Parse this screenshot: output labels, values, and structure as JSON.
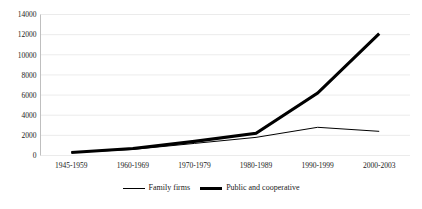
{
  "chart_data": {
    "type": "line",
    "title": "",
    "subtitle": "",
    "xlabel": "",
    "ylabel": "",
    "categories": [
      "1945-1959",
      "1960-1969",
      "1970-1979",
      "1980-1989",
      "1990-1999",
      "2000-2003"
    ],
    "series": [
      {
        "name": "Family firms",
        "values": [
          300,
          600,
          1200,
          1800,
          2800,
          2400
        ],
        "line_style": "thin",
        "color": "#000000"
      },
      {
        "name": "Public and cooperative",
        "values": [
          300,
          700,
          1400,
          2200,
          6200,
          12100
        ],
        "line_style": "thick",
        "color": "#000000"
      }
    ],
    "ylim": [
      0,
      14000
    ],
    "ytick_values": [
      0,
      2000,
      4000,
      6000,
      8000,
      10000,
      12000,
      14000
    ],
    "ytick_labels": [
      "0",
      "2000",
      "4000",
      "6000",
      "8000",
      "10000",
      "12000",
      "14000"
    ],
    "grid": true,
    "grid_color": "#e2e2e2",
    "legend_position": "bottom"
  },
  "legend": {
    "entries": [
      {
        "label": "Family firms",
        "style": "thin"
      },
      {
        "label": "Public and cooperative",
        "style": "thick"
      }
    ]
  },
  "colors": {
    "series_color": "#000000",
    "grid": "#e2e2e2",
    "axis": "#b8b8b8",
    "background": "#ffffff",
    "text": "#1a1a1a"
  }
}
